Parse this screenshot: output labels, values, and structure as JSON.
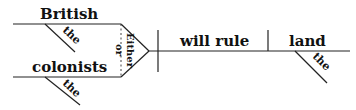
{
  "diagram": {
    "type": "sentence-diagram",
    "compound_subject": {
      "conjunction_top": "Either",
      "conjunction_bottom": "or",
      "subjects": [
        {
          "word": "British",
          "modifier": "the"
        },
        {
          "word": "colonists",
          "modifier": "the"
        }
      ]
    },
    "verb": "will rule",
    "object": {
      "word": "land",
      "modifier": "the"
    },
    "colors": {
      "line": "#222222",
      "text": "#111111",
      "background": "#ffffff"
    }
  }
}
